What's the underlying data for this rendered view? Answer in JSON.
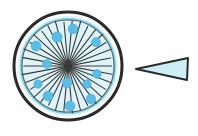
{
  "figure": {
    "title": "Radial circular structure with detached wedge segment",
    "background_color": "#fefefe",
    "width": 198,
    "height": 136
  },
  "palette": {
    "outline_dark": "#2b2b2b",
    "outline_soft": "#4a4a4a",
    "inner_ring_stroke": "#7fd0e6",
    "body_fill": "#ddf3f8",
    "dot_fill": "#5bbce4",
    "dot_stroke": "#3ba7d6",
    "wedge_fill": "#cdeef5",
    "wedge_stroke": "#2b2b2b",
    "spoke_color": "#3a3a3a"
  },
  "main_body": {
    "name": "radial-disc",
    "center_x": 68,
    "center_y": 66,
    "outer_radius": 54,
    "outer_stroke_width": 3,
    "inner_ring_radius": 47,
    "inner_ring_stroke_width": 2,
    "fill_radius": 50
  },
  "spokes": {
    "name": "radiating-spokes",
    "count": 34,
    "hub_x": 68,
    "hub_y": 66,
    "inner_start_radius": 2,
    "outer_end_radius": 45,
    "stroke_width": 1.1,
    "angles_deg": [
      0,
      10.6,
      21.2,
      31.8,
      42.4,
      53,
      63.5,
      74.1,
      84.7,
      95.3,
      105.9,
      116.5,
      127.1,
      137.6,
      148.2,
      158.8,
      169.4,
      180,
      190.6,
      201.2,
      211.8,
      222.4,
      233,
      243.5,
      254.1,
      264.7,
      275.3,
      285.9,
      296.5,
      307.1,
      317.6,
      328.2,
      338.8,
      349.4
    ]
  },
  "dots": {
    "name": "spoke-tip-dots",
    "count": 12,
    "radius": 4.6,
    "positions": [
      {
        "x": 73,
        "y": 29,
        "r": 5.0
      },
      {
        "x": 57,
        "y": 37,
        "r": 5.2
      },
      {
        "x": 96,
        "y": 42,
        "r": 4.6
      },
      {
        "x": 36,
        "y": 46,
        "r": 5.0
      },
      {
        "x": 47,
        "y": 64,
        "r": 4.4
      },
      {
        "x": 97,
        "y": 74,
        "r": 4.4
      },
      {
        "x": 67,
        "y": 83,
        "r": 4.8
      },
      {
        "x": 87,
        "y": 84,
        "r": 4.2
      },
      {
        "x": 38,
        "y": 84,
        "r": 4.2
      },
      {
        "x": 48,
        "y": 96,
        "r": 5.0
      },
      {
        "x": 91,
        "y": 99,
        "r": 4.8
      },
      {
        "x": 70,
        "y": 106,
        "r": 5.0
      }
    ]
  },
  "wedge": {
    "name": "detached-wedge-segment",
    "apex_x": 136,
    "apex_y": 69,
    "top_right_x": 188,
    "top_right_y": 58,
    "bottom_right_x": 187,
    "bottom_right_y": 80,
    "stroke_width": 2
  }
}
